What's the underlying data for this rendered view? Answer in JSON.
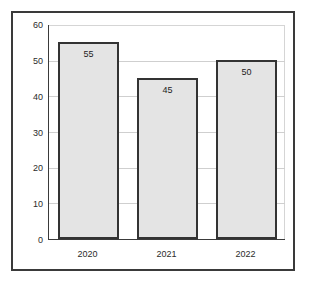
{
  "chart_data": {
    "type": "bar",
    "title": "",
    "subtitle": "",
    "xlabel": "",
    "ylabel": "",
    "categories": [
      "2020",
      "2021",
      "2022"
    ],
    "values": [
      55,
      45,
      50
    ],
    "data_labels": [
      "55",
      "45",
      "50"
    ],
    "ylim": [
      0,
      60
    ],
    "y_ticks": [
      0,
      10,
      20,
      30,
      40,
      50,
      60
    ],
    "y_tick_labels": [
      "0",
      "10",
      "20",
      "30",
      "40",
      "50",
      "60"
    ],
    "grid": true,
    "grid_axis": "y",
    "legend": false,
    "legend_position": "none",
    "series": [
      {
        "name": "",
        "values": [
          55,
          45,
          50
        ]
      }
    ],
    "colors": {
      "bar_fill": "#e4e4e4",
      "bar_edge": "#333333",
      "gridline": "#cfcfcf",
      "axis": "#3a3a3a",
      "frame": "#3a3a3a",
      "text": "#2b2b2b",
      "background": "#ffffff"
    }
  }
}
